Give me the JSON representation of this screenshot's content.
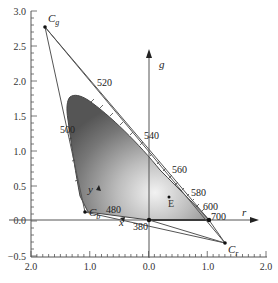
{
  "chart_data": {
    "type": "scatter",
    "title": "",
    "xlabel": "r",
    "ylabel": "g",
    "xlim": [
      -2.0,
      2.0
    ],
    "ylim": [
      -0.5,
      3.0
    ],
    "x_tick_labels": [
      "2.0",
      "1.0",
      "0.0",
      "1.0",
      "2.0"
    ],
    "y_tick_labels": [
      "3.0",
      "2.5",
      "2.0",
      "1.5",
      "1.0",
      "0.5",
      "0.0",
      "−0.5"
    ],
    "grid": false,
    "primaries": [
      {
        "name": "Cg",
        "label": "C",
        "sub": "g",
        "r": -1.76,
        "g": 2.76
      },
      {
        "name": "Cb",
        "label": "C",
        "sub": "b",
        "r": -1.08,
        "g": 0.11
      },
      {
        "name": "Cr",
        "label": "C",
        "sub": "r",
        "r": 1.29,
        "g": -0.33
      }
    ],
    "white_point": {
      "label": "E",
      "r": 0.33,
      "g": 0.33
    },
    "axis_points": [
      {
        "label": "x",
        "r": -0.48,
        "g": 0.03
      },
      {
        "label": "y",
        "r": -0.92,
        "g": 0.53
      }
    ],
    "wavelength_labels": [
      {
        "nm": "380",
        "r": 0.0,
        "g": 0.0
      },
      {
        "nm": "480",
        "r": -0.6,
        "g": 0.15
      },
      {
        "nm": "500",
        "r": -1.05,
        "g": 1.12
      },
      {
        "nm": "520",
        "r": -0.98,
        "g": 1.9
      },
      {
        "nm": "540",
        "r": 0.0,
        "g": 1.2
      },
      {
        "nm": "560",
        "r": 0.38,
        "g": 0.73
      },
      {
        "nm": "580",
        "r": 0.62,
        "g": 0.42
      },
      {
        "nm": "600",
        "r": 0.86,
        "g": 0.15
      },
      {
        "nm": "700",
        "r": 1.0,
        "g": 0.0
      }
    ]
  }
}
